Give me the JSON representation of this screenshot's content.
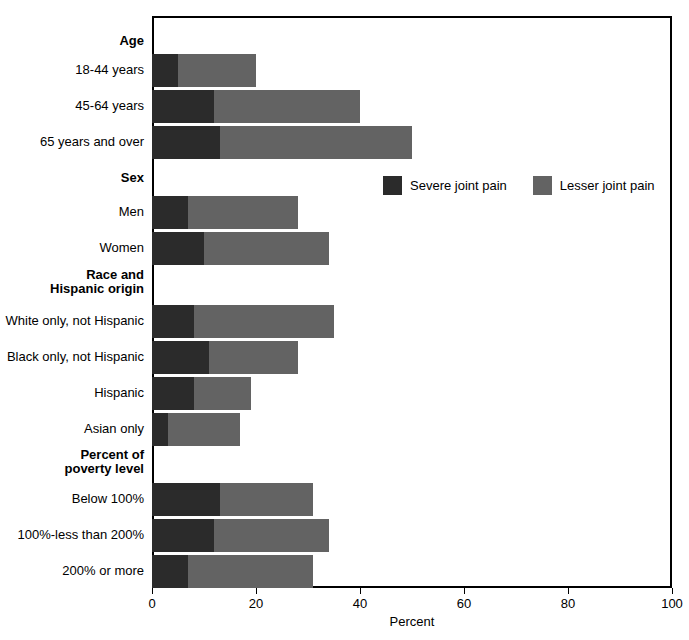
{
  "chart_data": {
    "type": "bar",
    "orientation": "horizontal",
    "stacked": true,
    "title": "",
    "xlabel": "Percent",
    "ylabel": "",
    "xlim": [
      0,
      100
    ],
    "xticks": [
      0,
      20,
      40,
      60,
      80,
      100
    ],
    "xtick_labels": [
      "0",
      "20",
      "40",
      "60",
      "80",
      "100"
    ],
    "grid": false,
    "legend_position": "upper-center-right",
    "colors": {
      "severe": "#2b2b2b",
      "lesser": "#636363",
      "background": "#ffffff",
      "axis": "#000000"
    },
    "series": [
      {
        "name": "Severe joint pain",
        "color": "#2b2b2b",
        "values": [
          5,
          12,
          13,
          7,
          10,
          8,
          11,
          8,
          3,
          13,
          12,
          7
        ]
      },
      {
        "name": "Lesser joint pain",
        "color": "#636363",
        "values": [
          15,
          28,
          37,
          21,
          24,
          27,
          17,
          11,
          14,
          18,
          22,
          24
        ]
      }
    ],
    "totals": [
      20,
      40,
      50,
      28,
      34,
      35,
      28,
      19,
      17,
      31,
      34,
      31
    ],
    "categories": [
      "18-44 years",
      "45-64 years",
      "65 years and over",
      "Men",
      "Women",
      "White only, not Hispanic",
      "Black only, not Hispanic",
      "Hispanic",
      "Asian only",
      "Below 100%",
      "100%-less than 200%",
      "200% or more"
    ],
    "group_headers": [
      "Age",
      "Sex",
      "Race and Hispanic origin",
      "Percent of poverty level"
    ]
  },
  "axis": {
    "x_title": "Percent",
    "ticks": [
      {
        "value": "0",
        "pct": 0
      },
      {
        "value": "20",
        "pct": 20
      },
      {
        "value": "40",
        "pct": 40
      },
      {
        "value": "60",
        "pct": 60
      },
      {
        "value": "80",
        "pct": 80
      },
      {
        "value": "100",
        "pct": 100
      }
    ]
  },
  "legend": {
    "items": [
      {
        "label": "Severe joint pain",
        "swatch": "severe"
      },
      {
        "label": "Lesser joint pain",
        "swatch": "lesser"
      }
    ]
  },
  "rows": [
    {
      "kind": "group",
      "label": "Age",
      "top": 18,
      "label_top": 18
    },
    {
      "kind": "bar",
      "label": "18-44 years",
      "top": 38,
      "label_top": 47,
      "severe": 5,
      "lesser": 15,
      "total": 20
    },
    {
      "kind": "bar",
      "label": "45-64 years",
      "top": 74,
      "label_top": 83,
      "severe": 12,
      "lesser": 28,
      "total": 40
    },
    {
      "kind": "bar",
      "label": "65 years and over",
      "top": 110,
      "label_top": 119,
      "severe": 13,
      "lesser": 37,
      "total": 50
    },
    {
      "kind": "group",
      "label": "Sex",
      "top": 155,
      "label_top": 155
    },
    {
      "kind": "bar",
      "label": "Men",
      "top": 180,
      "label_top": 189,
      "severe": 7,
      "lesser": 21,
      "total": 28
    },
    {
      "kind": "bar",
      "label": "Women",
      "top": 216,
      "label_top": 225,
      "severe": 10,
      "lesser": 24,
      "total": 34
    },
    {
      "kind": "group2",
      "label": "Race and",
      "label2": "Hispanic origin",
      "top": 252,
      "label_top": 252
    },
    {
      "kind": "bar",
      "label": "White only, not Hispanic",
      "top": 289,
      "label_top": 298,
      "severe": 8,
      "lesser": 27,
      "total": 35
    },
    {
      "kind": "bar",
      "label": "Black only, not Hispanic",
      "top": 325,
      "label_top": 334,
      "severe": 11,
      "lesser": 17,
      "total": 28
    },
    {
      "kind": "bar",
      "label": "Hispanic",
      "top": 361,
      "label_top": 370,
      "severe": 8,
      "lesser": 11,
      "total": 19
    },
    {
      "kind": "bar",
      "label": "Asian only",
      "top": 397,
      "label_top": 406,
      "severe": 3,
      "lesser": 14,
      "total": 17
    },
    {
      "kind": "group2",
      "label": "Percent of",
      "label2": "poverty level",
      "top": 432,
      "label_top": 432
    },
    {
      "kind": "bar",
      "label": "Below 100%",
      "top": 467,
      "label_top": 476,
      "severe": 13,
      "lesser": 18,
      "total": 31
    },
    {
      "kind": "bar",
      "label": "100%-less than 200%",
      "top": 503,
      "label_top": 512,
      "severe": 12,
      "lesser": 22,
      "total": 34
    },
    {
      "kind": "bar",
      "label": "200% or more",
      "top": 539,
      "label_top": 548,
      "severe": 7,
      "lesser": 24,
      "total": 31
    }
  ]
}
